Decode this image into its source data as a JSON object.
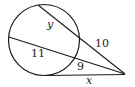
{
  "diagram": {
    "type": "circle-secant-tangent",
    "labels": {
      "y": "y",
      "ten": "10",
      "eleven": "11",
      "nine": "9",
      "x": "x"
    },
    "colors": {
      "stroke": "#1a1a1a",
      "text": "#222222"
    }
  }
}
